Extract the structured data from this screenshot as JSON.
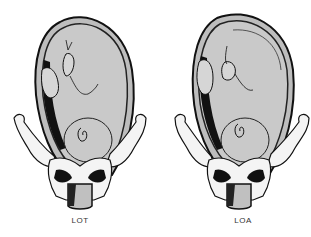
{
  "figures": [
    {
      "id": "left",
      "label": "LOT",
      "description": "Fetus in uterus within pelvis, left occiput transverse position"
    },
    {
      "id": "right",
      "label": "LOA",
      "description": "Fetus in uterus within pelvis, left occiput anterior position"
    }
  ],
  "colors": {
    "uterus_fill": "#c8c8c8",
    "outline": "#111111",
    "bone_fill": "#f4f4f4",
    "background": "#ffffff"
  }
}
